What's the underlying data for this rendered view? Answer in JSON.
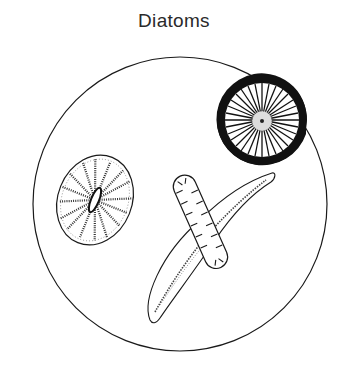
{
  "title": "Diatoms",
  "figure": {
    "field_of_view": "circular-microscope-view",
    "specimens": [
      {
        "name": "centric-diatom-radial-spokes",
        "shape": "disc",
        "fill": "dark-rim"
      },
      {
        "name": "centric-diatom-elliptical-stippled",
        "shape": "ellipse"
      },
      {
        "name": "pennate-diatom-sigmoid",
        "shape": "curved-leaf"
      },
      {
        "name": "pennate-diatom-rod-costae",
        "shape": "rounded-bar"
      }
    ]
  },
  "colors": {
    "line": "#1a1a1a",
    "background": "#ffffff"
  }
}
